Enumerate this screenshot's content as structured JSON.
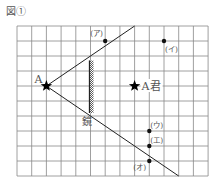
{
  "figure": {
    "title": "図①",
    "grid": {
      "columns": 13,
      "rows": 10
    },
    "colors": {
      "grid": "#888888",
      "line": "#222222",
      "text": "#555555"
    },
    "person_a": {
      "label": "A",
      "col": 2,
      "row": 4,
      "icon": "star-icon"
    },
    "person_a_kun": {
      "label": "A君",
      "col": 8,
      "row": 4,
      "icon": "star-icon"
    },
    "mirror": {
      "label": "鏡",
      "col": 5,
      "row_start": 2.3,
      "row_end": 5.8
    },
    "sight_lines": [
      {
        "name": "upper-line",
        "from": [
          2,
          4
        ],
        "to": [
          8,
          0
        ]
      },
      {
        "name": "lower-line",
        "from": [
          2,
          4
        ],
        "to": [
          11,
          10
        ]
      }
    ],
    "points": [
      {
        "label": "(ア)",
        "col": 6,
        "row": 1,
        "label_pos": "top-left"
      },
      {
        "label": "(イ)",
        "col": 10,
        "row": 1,
        "label_pos": "bottom-right"
      },
      {
        "label": "(ウ)",
        "col": 9,
        "row": 7,
        "label_pos": "top-right"
      },
      {
        "label": "(エ)",
        "col": 9,
        "row": 8,
        "label_pos": "top-right"
      },
      {
        "label": "(オ)",
        "col": 9,
        "row": 9,
        "label_pos": "bottom-left"
      }
    ]
  }
}
